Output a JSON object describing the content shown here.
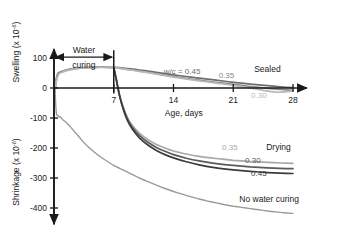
{
  "chart_data": {
    "type": "line",
    "title": "",
    "xlabel": "Age, days",
    "ylabel_top": "Swelling (x 10",
    "ylabel_top_sup": "-6",
    "ylabel_top_close": ")",
    "ylabel_bottom": "Shrinkage (x 10",
    "ylabel_bottom_sup": "-6",
    "ylabel_bottom_close": ")",
    "xlim": [
      0,
      28
    ],
    "ylim": [
      -450,
      130
    ],
    "xticks": [
      7,
      14,
      21,
      28
    ],
    "xtick_labels": [
      "7",
      "14",
      "21",
      "28"
    ],
    "yticks": [
      100,
      0,
      -100,
      -200,
      -300,
      -400
    ],
    "ytick_labels": [
      "100",
      "0",
      "-100",
      "-200",
      "-300",
      "-400"
    ],
    "grid": false,
    "legend_position": "inline-annotations",
    "annotations": [
      {
        "name": "water-curing",
        "text_line1": "Water",
        "text_line2": "curing",
        "x": 3.5,
        "y": 120
      },
      {
        "name": "sealed-group",
        "text": "Sealed",
        "x": 25.0,
        "y": 55
      },
      {
        "name": "drying-group",
        "text": "Drying",
        "x": 26.3,
        "y": -205
      },
      {
        "name": "no-water-curing",
        "text": "No water curing",
        "x": 25.2,
        "y": -380
      }
    ],
    "curing_divider_day": 7,
    "series": [
      {
        "name": "sealed-wc-0.45",
        "label": "w/c = 0.45",
        "label_x": 15.0,
        "label_y": 48,
        "color": "#6e6e6e",
        "width": 1.7,
        "points": [
          [
            0.1,
            -8
          ],
          [
            0.25,
            28
          ],
          [
            0.45,
            48
          ],
          [
            0.7,
            52
          ],
          [
            1.0,
            55
          ],
          [
            1.5,
            60
          ],
          [
            2.2,
            64
          ],
          [
            3.0,
            67
          ],
          [
            4.0,
            69
          ],
          [
            5.0,
            70
          ],
          [
            6.0,
            70
          ],
          [
            7.0,
            69
          ],
          [
            9.0,
            64
          ],
          [
            11.0,
            56
          ],
          [
            13.0,
            48
          ],
          [
            15.0,
            40
          ],
          [
            17.0,
            33
          ],
          [
            19.0,
            26
          ],
          [
            21.0,
            19
          ],
          [
            23.0,
            13
          ],
          [
            25.0,
            8
          ],
          [
            26.5,
            4
          ],
          [
            28.0,
            1
          ]
        ]
      },
      {
        "name": "sealed-wc-0.35",
        "label": "0.35",
        "label_x": 20.2,
        "label_y": 32,
        "color": "#8a8a8a",
        "width": 1.7,
        "points": [
          [
            0.1,
            -10
          ],
          [
            0.3,
            30
          ],
          [
            0.5,
            50
          ],
          [
            0.8,
            54
          ],
          [
            1.2,
            58
          ],
          [
            2.0,
            63
          ],
          [
            3.0,
            66
          ],
          [
            4.0,
            68
          ],
          [
            5.0,
            69
          ],
          [
            6.0,
            69
          ],
          [
            7.0,
            68
          ],
          [
            9.0,
            61
          ],
          [
            11.0,
            52
          ],
          [
            13.0,
            43
          ],
          [
            15.0,
            34
          ],
          [
            17.0,
            26
          ],
          [
            19.0,
            19
          ],
          [
            21.0,
            12
          ],
          [
            23.0,
            5
          ],
          [
            25.0,
            -1
          ],
          [
            26.5,
            -5
          ],
          [
            28.0,
            -8
          ]
        ]
      },
      {
        "name": "sealed-wc-0.30",
        "label": "0.30",
        "label_x": 24.0,
        "label_y": -32,
        "color": "#b8b8b8",
        "width": 1.7,
        "points": [
          [
            0.1,
            -12
          ],
          [
            0.3,
            26
          ],
          [
            0.55,
            46
          ],
          [
            0.9,
            52
          ],
          [
            1.4,
            57
          ],
          [
            2.2,
            62
          ],
          [
            3.2,
            66
          ],
          [
            4.2,
            68
          ],
          [
            5.2,
            69
          ],
          [
            6.2,
            69
          ],
          [
            7.0,
            68
          ],
          [
            9.0,
            60
          ],
          [
            11.0,
            51
          ],
          [
            13.0,
            41
          ],
          [
            15.0,
            32
          ],
          [
            17.0,
            24
          ],
          [
            19.0,
            16
          ],
          [
            21.0,
            9
          ],
          [
            23.0,
            0
          ],
          [
            24.5,
            -8
          ],
          [
            26.0,
            -14
          ],
          [
            27.0,
            -13
          ],
          [
            28.0,
            -9
          ]
        ]
      },
      {
        "name": "drying-wc-0.35",
        "label": "0.35",
        "label_x": 20.6,
        "label_y": -207,
        "color": "#a8a8a8",
        "width": 1.7,
        "points": [
          [
            7.0,
            68
          ],
          [
            7.3,
            30
          ],
          [
            7.6,
            -15
          ],
          [
            8.0,
            -55
          ],
          [
            8.5,
            -92
          ],
          [
            9.0,
            -118
          ],
          [
            10.0,
            -150
          ],
          [
            11.0,
            -172
          ],
          [
            12.0,
            -188
          ],
          [
            13.0,
            -200
          ],
          [
            14.0,
            -210
          ],
          [
            15.5,
            -220
          ],
          [
            17.0,
            -228
          ],
          [
            19.0,
            -235
          ],
          [
            21.0,
            -241
          ],
          [
            23.0,
            -245
          ],
          [
            25.0,
            -248
          ],
          [
            26.5,
            -250
          ],
          [
            28.0,
            -251
          ]
        ]
      },
      {
        "name": "drying-wc-0.30",
        "label": "0.30",
        "label_x": 23.3,
        "label_y": -250,
        "color": "#5a5a5a",
        "width": 1.7,
        "points": [
          [
            7.0,
            68
          ],
          [
            7.3,
            26
          ],
          [
            7.65,
            -22
          ],
          [
            8.05,
            -62
          ],
          [
            8.55,
            -100
          ],
          [
            9.1,
            -128
          ],
          [
            10.0,
            -158
          ],
          [
            11.0,
            -181
          ],
          [
            12.0,
            -198
          ],
          [
            13.0,
            -211
          ],
          [
            14.0,
            -222
          ],
          [
            15.5,
            -234
          ],
          [
            17.0,
            -243
          ],
          [
            19.0,
            -252
          ],
          [
            21.0,
            -258
          ],
          [
            23.0,
            -263
          ],
          [
            25.0,
            -266
          ],
          [
            26.5,
            -268
          ],
          [
            28.0,
            -269
          ]
        ]
      },
      {
        "name": "drying-wc-0.45",
        "label": "0.45",
        "label_x": 24.0,
        "label_y": -293,
        "color": "#3c3c3c",
        "width": 1.7,
        "points": [
          [
            7.0,
            68
          ],
          [
            7.35,
            22
          ],
          [
            7.7,
            -28
          ],
          [
            8.1,
            -70
          ],
          [
            8.6,
            -108
          ],
          [
            9.15,
            -136
          ],
          [
            10.0,
            -166
          ],
          [
            11.0,
            -190
          ],
          [
            12.0,
            -208
          ],
          [
            13.0,
            -222
          ],
          [
            14.0,
            -233
          ],
          [
            15.5,
            -246
          ],
          [
            17.0,
            -256
          ],
          [
            19.0,
            -266
          ],
          [
            21.0,
            -273
          ],
          [
            23.0,
            -278
          ],
          [
            25.0,
            -282
          ],
          [
            26.5,
            -284
          ],
          [
            28.0,
            -285
          ]
        ]
      },
      {
        "name": "no-water-curing",
        "label": "No water curing",
        "label_x": 25.2,
        "label_y": -380,
        "color": "#9a9a9a",
        "width": 1.4,
        "points": [
          [
            0.12,
            -5
          ],
          [
            0.2,
            -55
          ],
          [
            0.3,
            -88
          ],
          [
            0.45,
            -92
          ],
          [
            0.6,
            -96
          ],
          [
            0.8,
            -98
          ],
          [
            1.0,
            -105
          ],
          [
            1.3,
            -112
          ],
          [
            1.6,
            -120
          ],
          [
            2.0,
            -132
          ],
          [
            2.6,
            -152
          ],
          [
            3.2,
            -172
          ],
          [
            4.0,
            -196
          ],
          [
            5.0,
            -220
          ],
          [
            6.0,
            -240
          ],
          [
            7.0,
            -258
          ],
          [
            8.0,
            -272
          ],
          [
            9.0,
            -286
          ],
          [
            10.0,
            -300
          ],
          [
            11.0,
            -312
          ],
          [
            12.0,
            -324
          ],
          [
            13.0,
            -335
          ],
          [
            14.0,
            -345
          ],
          [
            15.0,
            -354
          ],
          [
            16.0,
            -362
          ],
          [
            17.0,
            -370
          ],
          [
            18.0,
            -377
          ],
          [
            19.0,
            -383
          ],
          [
            20.0,
            -389
          ],
          [
            21.0,
            -394
          ],
          [
            22.0,
            -398
          ],
          [
            23.0,
            -402
          ],
          [
            24.0,
            -406
          ],
          [
            25.0,
            -410
          ],
          [
            26.0,
            -413
          ],
          [
            27.0,
            -416
          ],
          [
            28.0,
            -418
          ]
        ]
      }
    ]
  }
}
